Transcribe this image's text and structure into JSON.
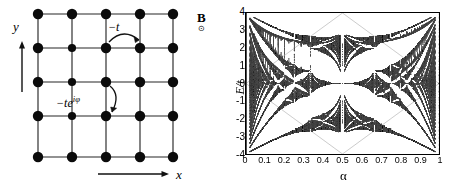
{
  "figure": {
    "panels": [
      "lattice-diagram",
      "hofstadter-butterfly"
    ]
  },
  "lattice": {
    "title": "",
    "rows": 5,
    "cols": 5,
    "node_label": "lattice-site",
    "axis_x_label": "x",
    "axis_y_label": "y",
    "hopping_label": "−t",
    "hopping_phase_label_base": "−te",
    "hopping_phase_label_exp": "iφ",
    "field_label": "B",
    "field_symbol": "⊙",
    "field_symbol_name": "out-of-page-field-icon",
    "site_color": "#0b0b0b",
    "bond_color": "#6e6e6e",
    "site_radius": 5.2,
    "site_xs": [
      38,
      72,
      106,
      140,
      173
    ],
    "site_ys": [
      14,
      48,
      82,
      116,
      157
    ],
    "x_arrow": {
      "x1": 98,
      "y1": 174,
      "x2": 168,
      "y2": 174
    },
    "y_arrow": {
      "x1": 22,
      "y1": 92,
      "x2": 22,
      "y2": 42
    }
  },
  "chart_data": {
    "type": "scatter",
    "xlabel": "α",
    "ylabel": "E/t",
    "xlim": [
      0,
      1
    ],
    "ylim": [
      -4,
      4
    ],
    "grid": false,
    "legend": null,
    "xticks": [
      0,
      0.1,
      0.2,
      0.3,
      0.4,
      0.5,
      0.6,
      0.7,
      0.8,
      0.9,
      1
    ],
    "xticklabels": [
      "0",
      "0.1",
      "0.2",
      "0.3",
      "0.4",
      "0.5",
      "0.6",
      "0.7",
      "0.8",
      "0.9",
      "1"
    ],
    "yticks": [
      4,
      3,
      2,
      1,
      0,
      -1,
      -2,
      -3,
      -4
    ],
    "yticklabels": [
      "4",
      "3",
      "2",
      "1",
      "0",
      "-1",
      "-2",
      "-3",
      "-4"
    ],
    "generator": {
      "model": "harper-hofstadter",
      "max_denominator": 49,
      "band_edges_only": false,
      "point_color": "#4d4d4d",
      "point_size": 0.55
    },
    "sampled_points_note": "Spectrum points are computed from the Harper equation eigenvalues for all rationals p/q with q <= max_denominator; alpha values are the rationals, E/t values the eigenvalues of the q x q Harper matrix.",
    "key_features": [
      {
        "alpha": 0.0,
        "E_range": [
          -4,
          4
        ],
        "note": "full tight-binding band, all energies"
      },
      {
        "alpha": 0.5,
        "E_bands": [
          [
            -2.828,
            0
          ],
          [
            0,
            2.828
          ]
        ],
        "note": "two touching bands, Dirac point at E=0"
      },
      {
        "alpha": 0.25,
        "bands": 4,
        "note": "four sub-bands"
      },
      {
        "alpha": 1.0,
        "E_range": [
          -4,
          4
        ],
        "note": "equivalent to alpha = 0"
      }
    ]
  }
}
